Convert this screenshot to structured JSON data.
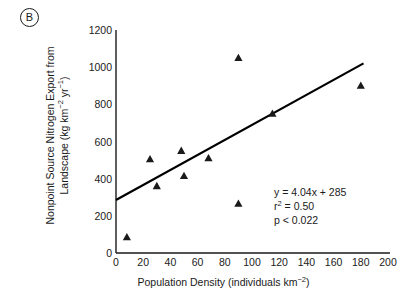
{
  "panel": {
    "label": "B"
  },
  "chart_data": {
    "type": "scatter",
    "title": "",
    "xlabel": "Population Density (individuals km−2)",
    "xlabel_parts": {
      "text": "Population Density (individuals km",
      "sup": "−2",
      "tail": ")"
    },
    "ylabel": "Nonpoint Source Nitrogen Export from Landscape (kg km−2 yr−1)",
    "ylabel_line1": "Nonpoint Source Nitrogen Export from",
    "ylabel_line2_a": "Landscape (kg km",
    "ylabel_line2_sup1": "−2",
    "ylabel_line2_b": " yr",
    "ylabel_line2_sup2": "−1",
    "ylabel_line2_c": ")",
    "xlim": [
      0,
      200
    ],
    "ylim": [
      0,
      1200
    ],
    "xticks": [
      0,
      20,
      40,
      60,
      80,
      100,
      120,
      140,
      160,
      180,
      200
    ],
    "yticks": [
      0,
      200,
      400,
      600,
      800,
      1000,
      1200
    ],
    "grid": false,
    "legend": false,
    "marker": "triangle-up",
    "marker_color": "#1a1a1a",
    "x": [
      8,
      25,
      30,
      48,
      50,
      68,
      90,
      90,
      115,
      180
    ],
    "y": [
      85,
      505,
      360,
      550,
      415,
      510,
      1050,
      265,
      750,
      900
    ],
    "points": [
      {
        "x": 8,
        "y": 85
      },
      {
        "x": 25,
        "y": 505
      },
      {
        "x": 30,
        "y": 360
      },
      {
        "x": 48,
        "y": 550
      },
      {
        "x": 50,
        "y": 415
      },
      {
        "x": 68,
        "y": 510
      },
      {
        "x": 90,
        "y": 1050
      },
      {
        "x": 90,
        "y": 265
      },
      {
        "x": 115,
        "y": 750
      },
      {
        "x": 180,
        "y": 900
      }
    ],
    "fit_line": {
      "type": "linear",
      "slope": 4.04,
      "intercept": 285,
      "x_start": 0,
      "x_end": 182,
      "color": "#000000"
    },
    "annotations": {
      "equation_y": "y",
      "equation_rest": " = 4.04x + 285",
      "r2_base": "r",
      "r2_sup": "2",
      "r2_rest": " = 0.50",
      "pvalue": "p < 0.022"
    }
  }
}
